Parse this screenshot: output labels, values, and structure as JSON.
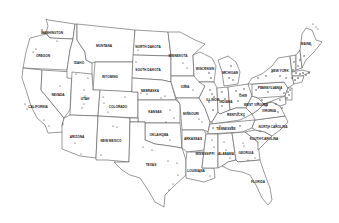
{
  "map": {
    "title": "",
    "region": "Contiguous United States",
    "line_color": "#555555",
    "dot_color": "#333333",
    "states": [
      {
        "name": "WASHINGTON",
        "x": 52,
        "y": 34
      },
      {
        "name": "OREGON",
        "x": 43,
        "y": 57
      },
      {
        "name": "CALIFORNIA",
        "x": 38,
        "y": 108
      },
      {
        "name": "NEVADA",
        "x": 58,
        "y": 96
      },
      {
        "name": "IDAHO",
        "x": 79,
        "y": 64
      },
      {
        "name": "MONTANA",
        "x": 104,
        "y": 47
      },
      {
        "name": "WYOMING",
        "x": 110,
        "y": 78
      },
      {
        "name": "UTAH",
        "x": 85,
        "y": 100
      },
      {
        "name": "COLORADO",
        "x": 118,
        "y": 108
      },
      {
        "name": "ARIZONA",
        "x": 77,
        "y": 138
      },
      {
        "name": "NEW MEXICO",
        "x": 111,
        "y": 142
      },
      {
        "name": "NORTH DAKOTA",
        "x": 148,
        "y": 48
      },
      {
        "name": "SOUTH DAKOTA",
        "x": 148,
        "y": 71
      },
      {
        "name": "NEBRASKA",
        "x": 150,
        "y": 92
      },
      {
        "name": "KANSAS",
        "x": 155,
        "y": 113
      },
      {
        "name": "OKLAHOMA",
        "x": 159,
        "y": 136
      },
      {
        "name": "TEXAS",
        "x": 151,
        "y": 166
      },
      {
        "name": "MINNESOTA",
        "x": 178,
        "y": 57
      },
      {
        "name": "IOWA",
        "x": 185,
        "y": 88
      },
      {
        "name": "MISSOURI",
        "x": 191,
        "y": 115
      },
      {
        "name": "ARKANSAS",
        "x": 193,
        "y": 140
      },
      {
        "name": "LOUISIANA",
        "x": 196,
        "y": 172
      },
      {
        "name": "WISCONSIN",
        "x": 205,
        "y": 70
      },
      {
        "name": "ILLINOIS",
        "x": 213,
        "y": 101
      },
      {
        "name": "MICHIGAN",
        "x": 230,
        "y": 74
      },
      {
        "name": "INDIANA",
        "x": 226,
        "y": 103
      },
      {
        "name": "OHIO",
        "x": 243,
        "y": 97
      },
      {
        "name": "KENTUCKY",
        "x": 236,
        "y": 116
      },
      {
        "name": "TENNESSEE",
        "x": 226,
        "y": 130
      },
      {
        "name": "MISSISSIPPI",
        "x": 205,
        "y": 155
      },
      {
        "name": "ALABAMA",
        "x": 226,
        "y": 155
      },
      {
        "name": "GEORGIA",
        "x": 246,
        "y": 154
      },
      {
        "name": "FLORIDA",
        "x": 258,
        "y": 183
      },
      {
        "name": "SOUTH CAROLINA",
        "x": 264,
        "y": 140
      },
      {
        "name": "NORTH CAROLINA",
        "x": 273,
        "y": 128
      },
      {
        "name": "VIRGINIA",
        "x": 269,
        "y": 112
      },
      {
        "name": "WEST VIRGINIA",
        "x": 256,
        "y": 106
      },
      {
        "name": "PENNSYLVANIA",
        "x": 270,
        "y": 89
      },
      {
        "name": "NEW YORK",
        "x": 280,
        "y": 72
      },
      {
        "name": "MAINE",
        "x": 306,
        "y": 45
      }
    ]
  }
}
